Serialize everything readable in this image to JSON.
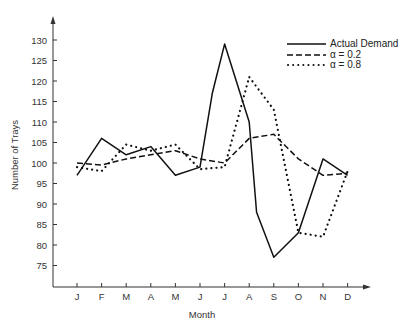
{
  "chart_data": {
    "type": "line",
    "title": "",
    "xlabel": "Month",
    "ylabel": "Number of Trays",
    "categories": [
      "J",
      "F",
      "M",
      "A",
      "M",
      "J",
      "J",
      "A",
      "S",
      "O",
      "N",
      "D"
    ],
    "yticks": [
      75,
      80,
      85,
      90,
      95,
      100,
      105,
      110,
      115,
      120,
      125,
      130
    ],
    "ylim": [
      70,
      135
    ],
    "grid": false,
    "legend_position": "top-right",
    "series": [
      {
        "name": "Actual Demand",
        "style": "solid",
        "values": [
          97,
          106,
          102,
          104,
          97,
          99,
          129,
          110,
          77,
          83,
          101,
          97
        ],
        "extra_points": [
          {
            "x": 5.5,
            "value": 117
          },
          {
            "x": 7.3,
            "value": 88
          }
        ]
      },
      {
        "name": "α = 0.2",
        "style": "dashed",
        "values": [
          100,
          99.5,
          101,
          102,
          103,
          101,
          100,
          106,
          107,
          101,
          97,
          97.5
        ]
      },
      {
        "name": "α = 0.8",
        "style": "dotted",
        "values": [
          99,
          98,
          104.5,
          103,
          104.5,
          98.5,
          99,
          121,
          113,
          83,
          82,
          98
        ]
      }
    ]
  },
  "legend": {
    "items": [
      {
        "label": "Actual Demand"
      },
      {
        "label": "α  =  0.2"
      },
      {
        "label": "α  =  0.8"
      }
    ]
  },
  "axes": {
    "xlabel": "Month",
    "ylabel": "Number of Trays"
  }
}
